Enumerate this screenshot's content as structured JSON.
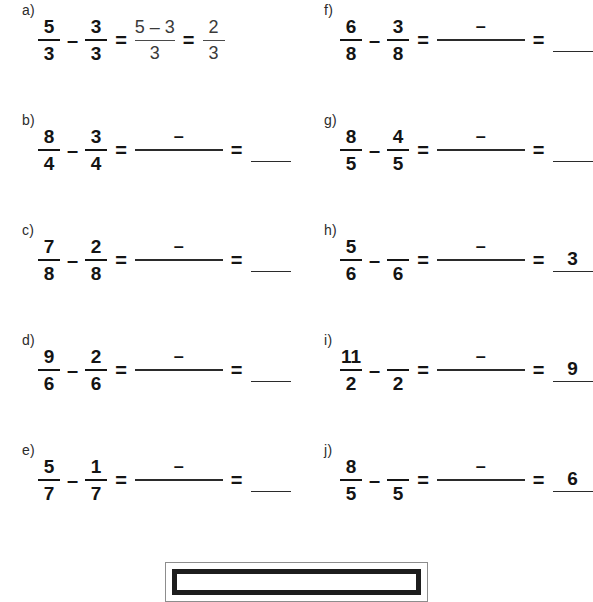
{
  "worksheet": {
    "columns": [
      {
        "name": "left-column",
        "problems": [
          {
            "label": "a)",
            "first": {
              "num": "5",
              "den": "3"
            },
            "minus": "–",
            "second": {
              "num": "3",
              "den": "3"
            },
            "equals1": "=",
            "middle": {
              "num": "5 – 3",
              "den": "3",
              "solved": true
            },
            "equals2": "=",
            "result": {
              "num": "2",
              "den": "3",
              "solved": true
            }
          },
          {
            "label": "b)",
            "first": {
              "num": "8",
              "den": "4"
            },
            "minus": "–",
            "second": {
              "num": "3",
              "den": "4"
            },
            "equals1": "=",
            "middle": {
              "num": "–",
              "den": "",
              "solved": false
            },
            "equals2": "=",
            "result": {
              "num": "",
              "den": "",
              "solved": false
            }
          },
          {
            "label": "c)",
            "first": {
              "num": "7",
              "den": "8"
            },
            "minus": "–",
            "second": {
              "num": "2",
              "den": "8"
            },
            "equals1": "=",
            "middle": {
              "num": "–",
              "den": "",
              "solved": false
            },
            "equals2": "=",
            "result": {
              "num": "",
              "den": "",
              "solved": false
            }
          },
          {
            "label": "d)",
            "first": {
              "num": "9",
              "den": "6"
            },
            "minus": "–",
            "second": {
              "num": "2",
              "den": "6"
            },
            "equals1": "=",
            "middle": {
              "num": "–",
              "den": "",
              "solved": false
            },
            "equals2": "=",
            "result": {
              "num": "",
              "den": "",
              "solved": false
            }
          },
          {
            "label": "e)",
            "first": {
              "num": "5",
              "den": "7"
            },
            "minus": "–",
            "second": {
              "num": "1",
              "den": "7"
            },
            "equals1": "=",
            "middle": {
              "num": "–",
              "den": "",
              "solved": false
            },
            "equals2": "=",
            "result": {
              "num": "",
              "den": "",
              "solved": false
            }
          }
        ]
      },
      {
        "name": "right-column",
        "problems": [
          {
            "label": "f)",
            "first": {
              "num": "6",
              "den": "8"
            },
            "minus": "–",
            "second": {
              "num": "3",
              "den": "8"
            },
            "equals1": "=",
            "middle": {
              "num": "–",
              "den": "",
              "solved": false
            },
            "equals2": "=",
            "result": {
              "num": "",
              "den": "",
              "solved": false
            }
          },
          {
            "label": "g)",
            "first": {
              "num": "8",
              "den": "5"
            },
            "minus": "–",
            "second": {
              "num": "4",
              "den": "5"
            },
            "equals1": "=",
            "middle": {
              "num": "–",
              "den": "",
              "solved": false
            },
            "equals2": "=",
            "result": {
              "num": "",
              "den": "",
              "solved": false
            }
          },
          {
            "label": "h)",
            "first": {
              "num": "5",
              "den": "6"
            },
            "minus": "–",
            "second": {
              "num": "",
              "den": "6"
            },
            "equals1": "=",
            "middle": {
              "num": "–",
              "den": "",
              "solved": false
            },
            "equals2": "=",
            "result": {
              "num": "3",
              "den": "",
              "solved": false
            }
          },
          {
            "label": "i)",
            "first": {
              "num": "11",
              "den": "2"
            },
            "minus": "–",
            "second": {
              "num": "",
              "den": "2"
            },
            "equals1": "=",
            "middle": {
              "num": "–",
              "den": "",
              "solved": false
            },
            "equals2": "=",
            "result": {
              "num": "9",
              "den": "",
              "solved": false
            }
          },
          {
            "label": "j)",
            "first": {
              "num": "8",
              "den": "5"
            },
            "minus": "–",
            "second": {
              "num": "",
              "den": "5"
            },
            "equals1": "=",
            "middle": {
              "num": "–",
              "den": "",
              "solved": false
            },
            "equals2": "=",
            "result": {
              "num": "6",
              "den": "",
              "solved": false
            }
          }
        ]
      }
    ],
    "bottom_frame": {
      "present": true
    }
  }
}
